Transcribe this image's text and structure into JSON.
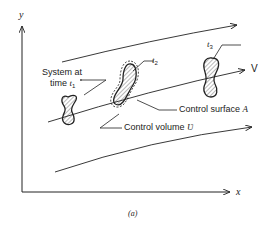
{
  "figure": {
    "caption": "(a)",
    "axes": {
      "x_label": "x",
      "y_label": "y"
    },
    "labels": {
      "system_line1": "System at",
      "system_line2": "time",
      "t1": "t",
      "t1_sub": "1",
      "t2": "t",
      "t2_sub": "2",
      "t3": "t",
      "t3_sub": "3",
      "velocity": "V",
      "control_surface": "Control surface",
      "control_surface_symbol": "A",
      "control_volume": "Control volume",
      "control_volume_symbol": "Ʋ"
    },
    "colors": {
      "ink": "#222222",
      "background": "#ffffff"
    }
  }
}
